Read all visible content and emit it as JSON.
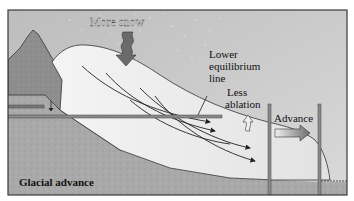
{
  "diagram": {
    "title": "Glacial advance",
    "labels": {
      "more_snow": "More snow",
      "equilibrium_line": [
        "Lower",
        "equilibrium",
        "line"
      ],
      "less_ablation": [
        "Less",
        "ablation"
      ],
      "advance": "Advance",
      "caption": "Glacial advance"
    },
    "colors": {
      "sky": "#c9c9c9",
      "ground": "#a8a8a8",
      "mountain": "#8f8f8f",
      "ice": "#ececec",
      "outline": "#2a2a2a",
      "arrow": "#6b6b6b",
      "frame": "#3a3a3a"
    }
  }
}
